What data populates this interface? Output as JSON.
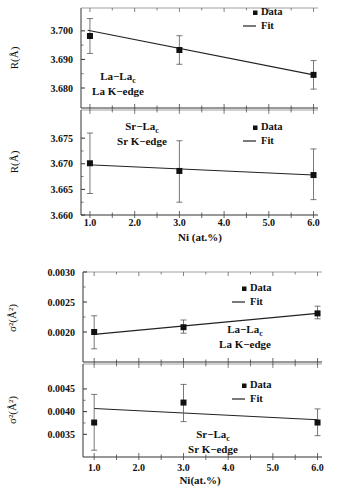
{
  "figure": {
    "xaxis_title_top": "Ni (at.%)",
    "xaxis_title_bottom": "Ni(at.%)"
  },
  "chart_data": [
    {
      "type": "line",
      "panel": "R La-La",
      "title": "",
      "xlabel": "",
      "ylabel": "R(Å)",
      "annotation_line1": "La−La",
      "annotation_sub": "c",
      "annotation_line2": "La K−edge",
      "legend": [
        "Data",
        "Fit"
      ],
      "legend_position": "upper right",
      "x": [
        1.0,
        3.0,
        6.0
      ],
      "series": [
        {
          "name": "Data",
          "values": [
            3.6982,
            3.6933,
            3.6846
          ],
          "err_low": [
            3.6921,
            3.6883,
            3.6796
          ],
          "err_high": [
            3.7043,
            3.6983,
            3.6896
          ]
        },
        {
          "name": "Fit",
          "x": [
            0.95,
            6.0
          ],
          "values": [
            3.7002,
            3.6846
          ]
        }
      ],
      "xlim": [
        0.8,
        6.1
      ],
      "ylim": [
        3.673,
        3.708
      ],
      "yticks": [
        3.68,
        3.69,
        3.7
      ],
      "ytick_labels": [
        "3.680",
        "3.690",
        "3.700"
      ],
      "grid": false
    },
    {
      "type": "line",
      "panel": "R Sr-La",
      "xlabel": "Ni (at.%)",
      "ylabel": "R(Å)",
      "annotation_line1": "Sr−La",
      "annotation_sub": "c",
      "annotation_line2": "Sr K−edge",
      "legend": [
        "Data",
        "Fit"
      ],
      "legend_position": "upper right",
      "x": [
        1.0,
        3.0,
        6.0
      ],
      "series": [
        {
          "name": "Data",
          "values": [
            3.6701,
            3.6686,
            3.6678
          ],
          "err_low": [
            3.6642,
            3.6625,
            3.663
          ],
          "err_high": [
            3.676,
            3.6745,
            3.6729
          ]
        },
        {
          "name": "Fit",
          "x": [
            0.95,
            6.0
          ],
          "values": [
            3.6698,
            3.6678
          ]
        }
      ],
      "xlim": [
        0.8,
        6.1
      ],
      "xticks": [
        1.0,
        2.0,
        3.0,
        4.0,
        5.0,
        6.0
      ],
      "xtick_labels": [
        "1.0",
        "2.0",
        "3.0",
        "4.0",
        "5.0",
        "6.0"
      ],
      "ylim": [
        3.66,
        3.6805
      ],
      "yticks": [
        3.66,
        3.665,
        3.67,
        3.675
      ],
      "ytick_labels": [
        "3.660",
        "3.665",
        "3.670",
        "3.675"
      ],
      "grid": false
    },
    {
      "type": "line",
      "panel": "sigma2 La-La",
      "ylabel": "σ²(Å²)",
      "annotation_line1": "La−La",
      "annotation_sub": "c",
      "annotation_line2": "La K−edge",
      "legend": [
        "Data",
        "Fit"
      ],
      "legend_position": "upper right",
      "x": [
        1.0,
        3.0,
        6.0
      ],
      "series": [
        {
          "name": "Data",
          "values": [
            0.002,
            0.00208,
            0.00231
          ],
          "err_low": [
            0.00172,
            0.00198,
            0.00222
          ],
          "err_high": [
            0.00227,
            0.0022,
            0.00243
          ]
        },
        {
          "name": "Fit",
          "x": [
            1.0,
            6.0
          ],
          "values": [
            0.00196,
            0.00231
          ]
        }
      ],
      "xlim": [
        0.75,
        6.1
      ],
      "ylim": [
        0.0015,
        0.003
      ],
      "yticks": [
        0.002,
        0.0025,
        0.003
      ],
      "ytick_labels": [
        "0.0020",
        "0.0025",
        "0.0030"
      ],
      "grid": false
    },
    {
      "type": "line",
      "panel": "sigma2 Sr-La",
      "xlabel": "Ni(at.%)",
      "ylabel": "σ²(Å²)",
      "annotation_line1": "Sr−La",
      "annotation_sub": "c",
      "annotation_line2": "Sr K−edge",
      "legend": [
        "Data",
        "Fit"
      ],
      "legend_position": "upper right",
      "x": [
        1.0,
        3.0,
        6.0
      ],
      "series": [
        {
          "name": "Data",
          "values": [
            0.00376,
            0.0042,
            0.00376
          ],
          "err_low": [
            0.00315,
            0.00378,
            0.00347
          ],
          "err_high": [
            0.00438,
            0.0046,
            0.00406
          ]
        },
        {
          "name": "Fit",
          "x": [
            1.0,
            6.0
          ],
          "values": [
            0.00407,
            0.00382
          ]
        }
      ],
      "xlim": [
        0.75,
        6.1
      ],
      "xticks": [
        1.0,
        2.0,
        3.0,
        4.0,
        5.0,
        6.0
      ],
      "xtick_labels": [
        "1.0",
        "2.0",
        "3.0",
        "4.0",
        "5.0",
        "6.0"
      ],
      "ylim": [
        0.003,
        0.00505
      ],
      "yticks": [
        0.0035,
        0.004,
        0.0045
      ],
      "ytick_labels": [
        "0.0035",
        "0.0040",
        "0.0045"
      ],
      "grid": false
    }
  ]
}
